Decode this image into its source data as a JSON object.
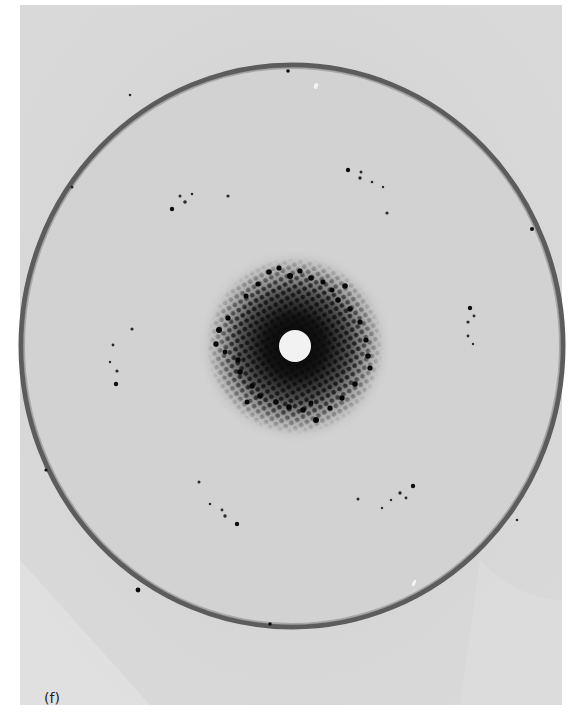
{
  "figure": {
    "panel_label": "(f)",
    "colors": {
      "page_background": "#ffffff",
      "plate_background": "#dcdcdc",
      "ring": "#5a5a5a",
      "spots": "#111111",
      "beam_stop": "#f4f4f4"
    },
    "plate": {
      "x": 20,
      "y": 5,
      "width": 542,
      "height": 700
    },
    "ring": {
      "cx": 292,
      "cy": 346,
      "rx": 271,
      "ry": 281
    },
    "beam_stop": {
      "cx": 295,
      "cy": 346,
      "r": 16
    }
  }
}
